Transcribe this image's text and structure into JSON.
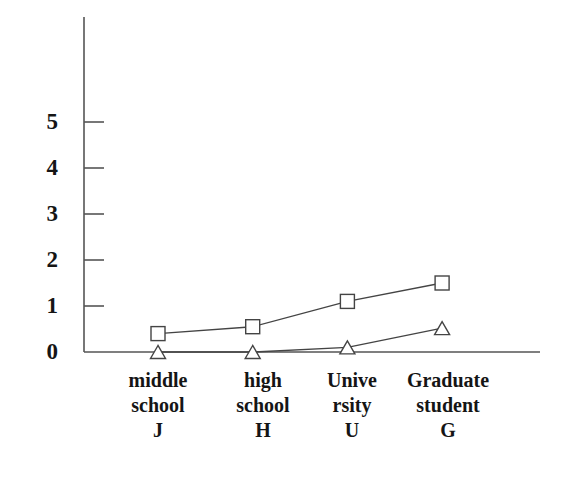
{
  "chart_data": {
    "type": "line",
    "title": "",
    "subtitle": "",
    "xlabel": "",
    "ylabel": "",
    "categories": [
      "middle school J",
      "high school H",
      "Unive rsity U",
      "Graduate student G"
    ],
    "category_lines": [
      [
        "middle",
        "school",
        "J"
      ],
      [
        "high",
        "school",
        "H"
      ],
      [
        "Unive",
        "rsity",
        "U"
      ],
      [
        "Graduate",
        "student",
        "G"
      ]
    ],
    "series": [
      {
        "name": "square-series",
        "marker": "square",
        "values": [
          0.4,
          0.55,
          1.1,
          1.5
        ]
      },
      {
        "name": "triangle-series",
        "marker": "triangle",
        "values": [
          0.0,
          0.0,
          0.1,
          0.52
        ]
      }
    ],
    "ylim": [
      0,
      5.5
    ],
    "yticks": [
      0,
      1,
      2,
      3,
      4,
      5
    ],
    "ytick_labels": [
      "0",
      "1",
      "2",
      "3",
      "4",
      "5"
    ],
    "grid": false,
    "legend": "none",
    "axis_color": "#555555",
    "line_color": "#444444",
    "marker_edge_color": "#444444",
    "marker_fill_color": "#ffffff",
    "background_color": "#ffffff"
  },
  "yticks": {
    "t0": "0",
    "t1": "1",
    "t2": "2",
    "t3": "3",
    "t4": "4",
    "t5": "5"
  },
  "categories": {
    "c0": {
      "l0": "middle",
      "l1": "school",
      "l2": "J"
    },
    "c1": {
      "l0": "high",
      "l1": "school",
      "l2": "H"
    },
    "c2": {
      "l0": "Unive",
      "l1": "rsity",
      "l2": "U"
    },
    "c3": {
      "l0": "Graduate",
      "l1": "student",
      "l2": "G"
    }
  }
}
